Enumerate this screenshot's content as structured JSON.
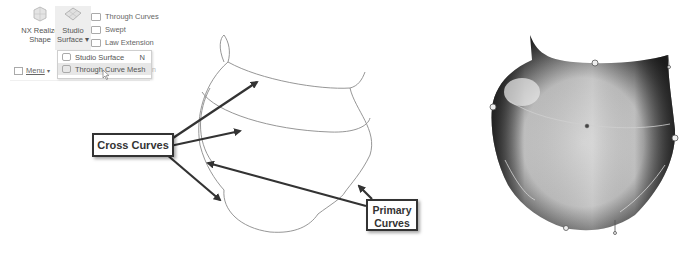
{
  "ribbon": {
    "nx_realize_shape": {
      "line1": "NX Realize",
      "line2": "Shape",
      "icon": "cube-mesh-icon"
    },
    "studio_surface": {
      "line1": "Studio",
      "line2": "Surface ▾",
      "icon": "surface-patch-icon"
    },
    "small_commands": [
      {
        "label": "Through Curves",
        "icon": "through-curves-icon"
      },
      {
        "label": "Swept",
        "icon": "swept-icon"
      },
      {
        "label": "Law Extension",
        "icon": "law-extension-icon"
      }
    ],
    "menu": {
      "label": "Menu",
      "arrow": "▾",
      "icon": "menu-icon"
    },
    "trailing_text": "n"
  },
  "dropdown": {
    "items": [
      {
        "label": "Studio Surface",
        "shortcut": "N",
        "icon": "studio-surface-icon"
      },
      {
        "label": "Through Curve Mesh",
        "shortcut": "",
        "icon": "through-curve-mesh-icon",
        "highlighted": true
      }
    ]
  },
  "diagram": {
    "callouts": {
      "cross": "Cross Curves",
      "primary_line1": "Primary",
      "primary_line2": "Curves"
    },
    "colors": {
      "curve": "#8a8a8a",
      "arrow": "#333333",
      "callout_border": "#333333"
    }
  }
}
